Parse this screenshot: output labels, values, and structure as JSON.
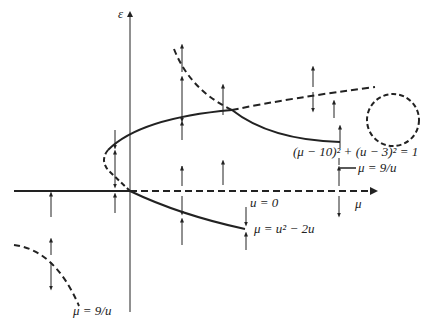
{
  "diagram": {
    "type": "bifurcation-diagram",
    "axes": {
      "vertical_label": "ε",
      "horizontal_label": "μ"
    },
    "curves": [
      {
        "id": "u-zero",
        "label": "u = 0"
      },
      {
        "id": "parabola",
        "label": "μ = u² − 2u"
      },
      {
        "id": "hyperbola-upper",
        "label": "μ = 9/u"
      },
      {
        "id": "hyperbola-lower",
        "label": "μ = 9/u"
      },
      {
        "id": "circle",
        "label": "(μ − 10)² + (u − 3)² = 1"
      }
    ],
    "legend_style": {
      "stable": "solid",
      "unstable": "dashed"
    },
    "colors": {
      "ink": "#222222",
      "background": "#ffffff"
    }
  },
  "labels": {
    "epsilon": "ε",
    "mu_axis": "μ",
    "u_zero": "u = 0",
    "parabola": "μ = u² − 2u",
    "hyperbola_upper": "μ = 9/u",
    "hyperbola_lower": "μ = 9/u",
    "circle": "(μ − 10)² + (u − 3)² = 1"
  }
}
